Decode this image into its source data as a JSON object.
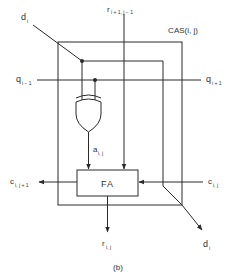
{
  "diagram": {
    "title": "CAS(i, j)",
    "caption": "(b)",
    "block_label": "FA",
    "labels": {
      "d_in": {
        "main": "d",
        "sub": "i"
      },
      "r_in": {
        "main": "r",
        "sub": "i + 1, j − 1"
      },
      "q_in": {
        "main": "q",
        "sub": "i − 1"
      },
      "q_out": {
        "main": "q",
        "sub": "i + 1"
      },
      "a": {
        "main": "a",
        "sub": "i, j"
      },
      "c_out": {
        "main": "c",
        "sub": "i, j + 1"
      },
      "c_in": {
        "main": "c",
        "sub": "i, j"
      },
      "r_out": {
        "main": "r",
        "sub": "i, j"
      },
      "d_out": {
        "main": "d",
        "sub": "i"
      }
    },
    "colors": {
      "line": "#2a2a2a",
      "text": "#333333",
      "background": "#ffffff"
    }
  }
}
